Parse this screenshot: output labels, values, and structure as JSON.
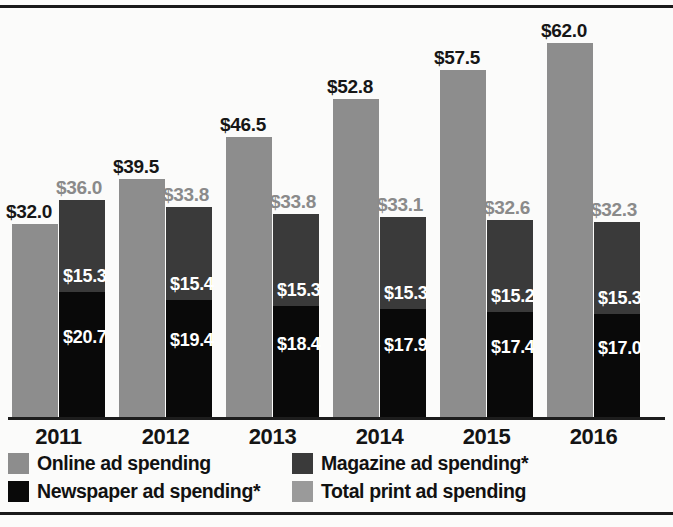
{
  "chart_data": {
    "type": "bar",
    "subtype": "grouped-with-stacked-column",
    "title": "",
    "subtitle": "",
    "xlabel": "",
    "ylabel": "",
    "ylim": [
      0,
      67
    ],
    "grid": false,
    "legend_position": "bottom",
    "categories": [
      "2011",
      "2012",
      "2013",
      "2014",
      "2015",
      "2016"
    ],
    "series": [
      {
        "name": "Online ad spending",
        "color": "#8d8d8d",
        "values": [
          32.0,
          39.5,
          46.5,
          52.8,
          57.5,
          62.0
        ],
        "labels": [
          "$32.0",
          "$39.5",
          "$46.5",
          "$52.8",
          "$57.5",
          "$62.0"
        ]
      },
      {
        "name": "Magazine ad spending*",
        "color": "#3a3a3a",
        "values": [
          15.3,
          15.4,
          15.3,
          15.3,
          15.2,
          15.3
        ],
        "labels": [
          "$15.3",
          "$15.4",
          "$15.3",
          "$15.3",
          "$15.2",
          "$15.3"
        ]
      },
      {
        "name": "Newspaper ad spending*",
        "color": "#090909",
        "values": [
          20.7,
          19.4,
          18.4,
          17.9,
          17.4,
          17.0
        ],
        "labels": [
          "$20.7",
          "$19.4",
          "$18.4",
          "$17.9",
          "$17.4",
          "$17.0"
        ]
      },
      {
        "name": "Total print ad spending",
        "color": "#9a9a9a",
        "values": [
          36.0,
          33.8,
          33.8,
          33.1,
          32.6,
          32.3
        ],
        "labels": [
          "$36.0",
          "$33.8",
          "$33.8",
          "$33.1",
          "$32.6",
          "$32.3"
        ]
      }
    ]
  },
  "axis": {
    "ticks": [
      "2011",
      "2012",
      "2013",
      "2014",
      "2015",
      "2016"
    ]
  },
  "legend": {
    "items": [
      {
        "label": "Online ad spending",
        "color": "#8d8d8d"
      },
      {
        "label": "Magazine ad spending*",
        "color": "#3a3a3a"
      },
      {
        "label": "Newspaper ad spending*",
        "color": "#090909"
      },
      {
        "label": "Total print ad spending",
        "color": "#9a9a9a"
      }
    ]
  },
  "colors": {
    "online": "#8d8d8d",
    "magazine": "#3a3a3a",
    "newspaper": "#090909",
    "total_print": "#9a9a9a",
    "axis": "#1d1d1d",
    "rule": "#1a1a1a",
    "background": "#fbfbfa"
  }
}
